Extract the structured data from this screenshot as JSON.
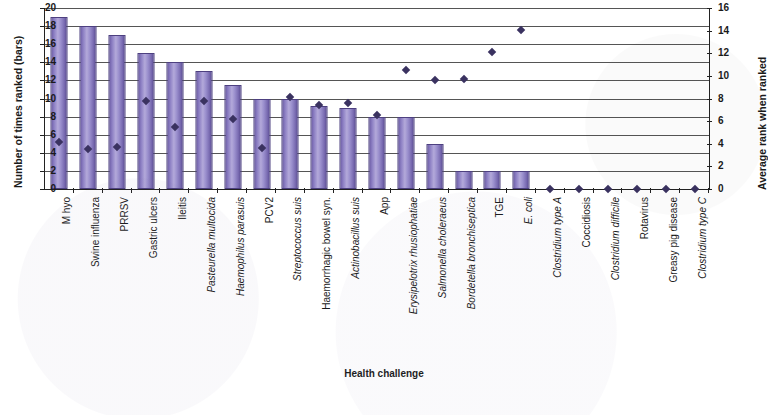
{
  "chart_data": {
    "type": "bar",
    "title": "",
    "xlabel": "Health challenge",
    "ylabel": "Number of times ranked (bars)",
    "y2label": "Average rank when ranked",
    "ylim": [
      0,
      20
    ],
    "y2lim": [
      0,
      16
    ],
    "yticks": [
      0,
      2,
      4,
      6,
      8,
      10,
      12,
      14,
      16,
      18,
      20
    ],
    "y2ticks": [
      0,
      2,
      4,
      6,
      8,
      10,
      12,
      14,
      16
    ],
    "grid": true,
    "legend": "none",
    "categories": [
      "M hyo",
      "Swine influenza",
      "PRRSV",
      "Gastric ulcers",
      "Ileitis",
      "Pasteurella multocida",
      "Haemophilus parasuis",
      "PCV2",
      "Streptococcus suis",
      "Haemorrhagic bowel syn.",
      "Actinobacillus suis",
      "App",
      "Erysipelotrix rhusiophatiae",
      "Salmonella choleraeus",
      "Bordetella bronchiseptica",
      "TGE",
      "E. coli",
      "Clostridium type A",
      "Coccidiosis",
      "Clostridium difficile",
      "Rotavirus",
      "Greasy pig disease",
      "Clostridium type C"
    ],
    "categories_italic": [
      false,
      false,
      false,
      false,
      false,
      true,
      true,
      false,
      true,
      false,
      true,
      false,
      true,
      true,
      true,
      false,
      true,
      true,
      false,
      true,
      false,
      false,
      true
    ],
    "series": [
      {
        "name": "Number of times ranked",
        "type": "bar",
        "axis": "left",
        "values": [
          19,
          18,
          17,
          15,
          14,
          13,
          11.5,
          10,
          10,
          9.2,
          9,
          8,
          8,
          5,
          2,
          2,
          2,
          0,
          0,
          0,
          0,
          0,
          0
        ]
      },
      {
        "name": "Average rank when ranked",
        "type": "scatter",
        "axis": "right",
        "values": [
          4.2,
          3.5,
          3.7,
          7.8,
          5.5,
          7.8,
          6.2,
          3.6,
          8.1,
          7.4,
          7.6,
          6.5,
          10.5,
          9.6,
          9.7,
          12.1,
          14.1,
          0,
          0,
          0,
          0,
          0,
          0
        ]
      }
    ],
    "colors": {
      "bar_fill": "#8d80c4",
      "bar_edge": "#4d4080",
      "marker": "#3a3260",
      "grid": "#555555",
      "axis": "#222222"
    }
  }
}
